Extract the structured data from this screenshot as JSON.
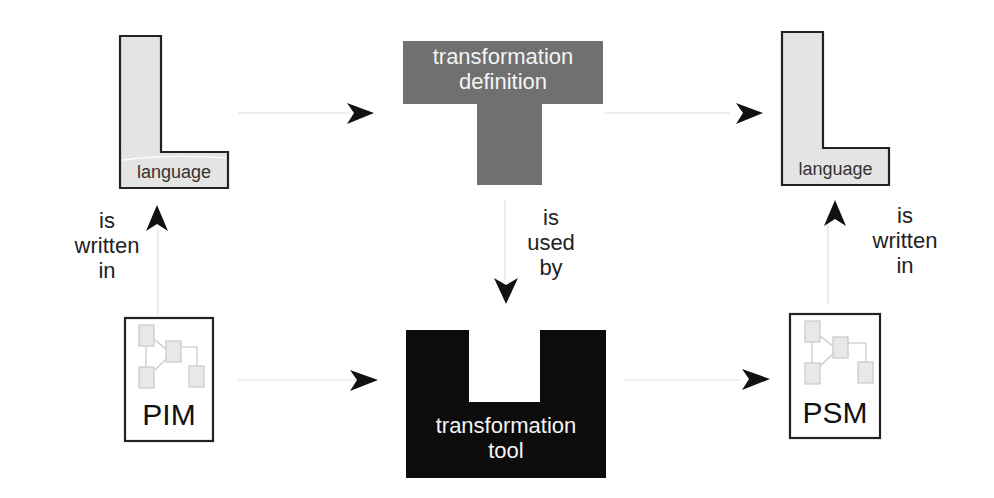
{
  "diagram": {
    "source_language": {
      "label": "language"
    },
    "target_language": {
      "label": "language"
    },
    "transformation_definition": {
      "line1": "transformation",
      "line2": "definition"
    },
    "transformation_tool": {
      "line1": "transformation",
      "line2": "tool"
    },
    "pim": {
      "label": "PIM"
    },
    "psm": {
      "label": "PSM"
    },
    "edges": {
      "pim_written_in": {
        "line1": "is",
        "line2": "written",
        "line3": "in"
      },
      "definition_used_by": {
        "line1": "is",
        "line2": "used",
        "line3": "by"
      },
      "psm_written_in": {
        "line1": "is",
        "line2": "written",
        "line3": "in"
      }
    },
    "colors": {
      "language_fill": "#e4e4e4",
      "definition_fill": "#707070",
      "tool_fill": "#0c0c0c",
      "arrow": "#111111",
      "connector": "#dddddd",
      "model_icon_fill": "#e8e8e8",
      "model_icon_stroke": "#c8c8c8"
    }
  }
}
